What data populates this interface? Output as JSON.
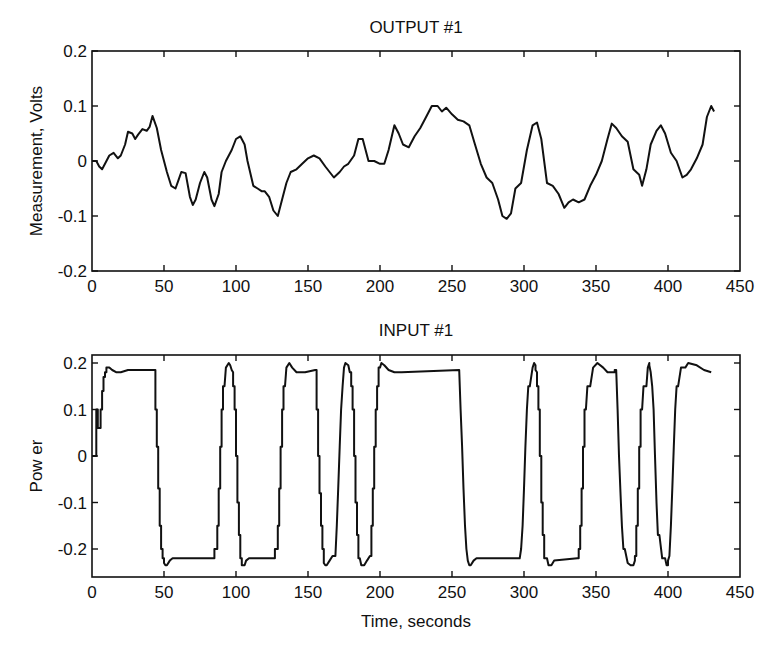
{
  "chart_data": [
    {
      "type": "line",
      "title": "OUTPUT #1",
      "xlabel": "",
      "ylabel": "Measurement, Volts",
      "xlim": [
        0,
        450
      ],
      "ylim": [
        -0.2,
        0.2
      ],
      "xticks": [
        "0",
        "50",
        "100",
        "150",
        "200",
        "250",
        "300",
        "350",
        "400",
        "450"
      ],
      "yticks": [
        "0.2",
        "0.1",
        "0",
        "-0.1",
        "-0.2"
      ],
      "grid": false,
      "series": [
        {
          "name": "output",
          "x": [
            0,
            3,
            5,
            7,
            9,
            12,
            15,
            18,
            20,
            23,
            25,
            28,
            30,
            32,
            35,
            38,
            40,
            42,
            45,
            48,
            52,
            55,
            58,
            60,
            62,
            65,
            68,
            70,
            72,
            75,
            78,
            80,
            83,
            85,
            88,
            90,
            93,
            95,
            97,
            100,
            103,
            106,
            108,
            112,
            115,
            118,
            120,
            123,
            126,
            129,
            132,
            135,
            138,
            142,
            146,
            150,
            154,
            158,
            162,
            165,
            168,
            172,
            175,
            178,
            182,
            185,
            188,
            192,
            196,
            200,
            203,
            206,
            210,
            213,
            216,
            220,
            224,
            228,
            232,
            236,
            240,
            243,
            246,
            250,
            254,
            258,
            262,
            266,
            270,
            274,
            278,
            282,
            285,
            288,
            291,
            294,
            298,
            302,
            306,
            309,
            312,
            316,
            320,
            324,
            328,
            331,
            334,
            338,
            342,
            346,
            350,
            354,
            358,
            361,
            364,
            368,
            372,
            376,
            380,
            382,
            385,
            388,
            392,
            395,
            398,
            402,
            406,
            410,
            413,
            416,
            420,
            424,
            427,
            430,
            432
          ],
          "y": [
            0.0,
            0.0,
            -0.01,
            -0.015,
            -0.005,
            0.01,
            0.015,
            0.005,
            0.01,
            0.03,
            0.053,
            0.05,
            0.04,
            0.048,
            0.058,
            0.055,
            0.062,
            0.082,
            0.06,
            0.02,
            -0.02,
            -0.045,
            -0.05,
            -0.035,
            -0.02,
            -0.022,
            -0.065,
            -0.08,
            -0.07,
            -0.04,
            -0.02,
            -0.03,
            -0.07,
            -0.082,
            -0.06,
            -0.02,
            0.0,
            0.01,
            0.02,
            0.04,
            0.045,
            0.03,
            0.0,
            -0.045,
            -0.05,
            -0.055,
            -0.055,
            -0.065,
            -0.09,
            -0.1,
            -0.07,
            -0.04,
            -0.02,
            -0.015,
            -0.005,
            0.005,
            0.01,
            0.005,
            -0.01,
            -0.02,
            -0.03,
            -0.02,
            -0.01,
            -0.005,
            0.01,
            0.04,
            0.04,
            0.0,
            0.0,
            -0.005,
            -0.005,
            0.02,
            0.065,
            0.05,
            0.03,
            0.025,
            0.045,
            0.06,
            0.08,
            0.1,
            0.1,
            0.09,
            0.097,
            0.085,
            0.075,
            0.072,
            0.065,
            0.03,
            -0.005,
            -0.03,
            -0.04,
            -0.07,
            -0.1,
            -0.105,
            -0.095,
            -0.05,
            -0.04,
            0.02,
            0.065,
            0.07,
            0.04,
            -0.04,
            -0.045,
            -0.06,
            -0.085,
            -0.075,
            -0.07,
            -0.075,
            -0.07,
            -0.045,
            -0.025,
            0.0,
            0.04,
            0.068,
            0.06,
            0.045,
            0.035,
            -0.015,
            -0.025,
            -0.045,
            -0.015,
            0.03,
            0.055,
            0.065,
            0.05,
            0.015,
            0.0,
            -0.03,
            -0.025,
            -0.015,
            0.005,
            0.03,
            0.08,
            0.1,
            0.09
          ]
        }
      ]
    },
    {
      "type": "line",
      "title": "INPUT #1",
      "xlabel": "Time, seconds",
      "ylabel": "Pow er",
      "xlim": [
        0,
        450
      ],
      "ylim": [
        -0.26,
        0.217
      ],
      "xticks": [
        "0",
        "50",
        "100",
        "150",
        "200",
        "250",
        "300",
        "350",
        "400",
        "450"
      ],
      "yticks": [
        "0.2",
        "0.1",
        "0",
        "-0.1",
        "-0.2"
      ],
      "grid": false,
      "series": [
        {
          "name": "input",
          "x": [
            0,
            3,
            3,
            4,
            4,
            6,
            6,
            7,
            7,
            8,
            8,
            9,
            9,
            10,
            10,
            12,
            14,
            17,
            20,
            25,
            27,
            44,
            44,
            45,
            45,
            46,
            46,
            47,
            47,
            48,
            48,
            49,
            49,
            50,
            50,
            51,
            52,
            54,
            56,
            58,
            85,
            85,
            87,
            87,
            88,
            88,
            89,
            89,
            90,
            90,
            91,
            91,
            92,
            93,
            95,
            96,
            97,
            98,
            98,
            99,
            99,
            100,
            100,
            101,
            101,
            102,
            102,
            103,
            103,
            104,
            104,
            106,
            107,
            109,
            111,
            113,
            127,
            127,
            129,
            129,
            130,
            130,
            131,
            131,
            132,
            132,
            133,
            133,
            134,
            135,
            137,
            139,
            142,
            148,
            155,
            156,
            156,
            157,
            157,
            158,
            158,
            159,
            159,
            160,
            160,
            161,
            161,
            162,
            163,
            165,
            167,
            169,
            170,
            170,
            171,
            171,
            172,
            172,
            173,
            173,
            174,
            174,
            175,
            176,
            178,
            179,
            180,
            180,
            181,
            181,
            182,
            182,
            183,
            183,
            184,
            184,
            185,
            185,
            186,
            187,
            189,
            191,
            193,
            194,
            194,
            195,
            195,
            196,
            196,
            197,
            197,
            198,
            198,
            199,
            199,
            200,
            201,
            203,
            206,
            210,
            215,
            255,
            255,
            256,
            256,
            257,
            257,
            258,
            258,
            259,
            259,
            260,
            260,
            261,
            261,
            262,
            263,
            265,
            267,
            297,
            297,
            298,
            298,
            299,
            299,
            300,
            300,
            301,
            301,
            302,
            302,
            303,
            304,
            306,
            307,
            308,
            308,
            309,
            309,
            310,
            310,
            311,
            311,
            312,
            312,
            313,
            313,
            314,
            314,
            316,
            317,
            319,
            321,
            337,
            337,
            338,
            338,
            339,
            339,
            340,
            340,
            341,
            341,
            342,
            342,
            343,
            344,
            346,
            348,
            351,
            355,
            358,
            363,
            363,
            364,
            364,
            365,
            365,
            366,
            366,
            367,
            367,
            368,
            368,
            369,
            370,
            372,
            374,
            376,
            377,
            377,
            378,
            378,
            379,
            379,
            380,
            380,
            381,
            381,
            382,
            383,
            385,
            386,
            387,
            387,
            388,
            388,
            389,
            389,
            390,
            390,
            391,
            391,
            392,
            392,
            393,
            394,
            396,
            398,
            399,
            400,
            400,
            401,
            401,
            402,
            402,
            403,
            403,
            404,
            404,
            405,
            405,
            406,
            407,
            409,
            412,
            414,
            420,
            425,
            430
          ],
          "y": [
            0.0,
            0.0,
            0.1,
            0.1,
            0.06,
            0.06,
            0.1,
            0.1,
            0.14,
            0.14,
            0.17,
            0.17,
            0.18,
            0.18,
            0.19,
            0.19,
            0.185,
            0.18,
            0.18,
            0.185,
            0.185,
            0.185,
            0.1,
            0.1,
            0.02,
            0.02,
            -0.07,
            -0.07,
            -0.15,
            -0.15,
            -0.2,
            -0.2,
            -0.22,
            -0.22,
            -0.23,
            -0.235,
            -0.235,
            -0.225,
            -0.22,
            -0.22,
            -0.22,
            -0.2,
            -0.2,
            -0.15,
            -0.15,
            -0.07,
            -0.07,
            0.02,
            0.02,
            0.1,
            0.1,
            0.15,
            0.15,
            0.19,
            0.2,
            0.195,
            0.185,
            0.18,
            0.15,
            0.15,
            0.1,
            0.1,
            0.0,
            0.0,
            -0.1,
            -0.1,
            -0.17,
            -0.17,
            -0.22,
            -0.22,
            -0.235,
            -0.235,
            -0.225,
            -0.22,
            -0.22,
            -0.22,
            -0.22,
            -0.2,
            -0.2,
            -0.15,
            -0.15,
            -0.07,
            -0.07,
            0.02,
            0.02,
            0.1,
            0.1,
            0.15,
            0.15,
            0.19,
            0.2,
            0.19,
            0.18,
            0.18,
            0.185,
            0.185,
            0.1,
            0.1,
            0.0,
            0.0,
            -0.08,
            -0.08,
            -0.15,
            -0.15,
            -0.2,
            -0.2,
            -0.23,
            -0.235,
            -0.235,
            -0.225,
            -0.215,
            -0.215,
            -0.15,
            -0.15,
            -0.07,
            -0.07,
            0.02,
            0.02,
            0.1,
            0.1,
            0.15,
            0.15,
            0.19,
            0.2,
            0.195,
            0.18,
            0.18,
            0.15,
            0.15,
            0.1,
            0.1,
            0.0,
            0.0,
            -0.1,
            -0.1,
            -0.17,
            -0.17,
            -0.22,
            -0.22,
            -0.235,
            -0.235,
            -0.225,
            -0.215,
            -0.215,
            -0.15,
            -0.15,
            -0.07,
            -0.07,
            0.02,
            0.02,
            0.1,
            0.1,
            0.15,
            0.15,
            0.19,
            0.19,
            0.2,
            0.195,
            0.185,
            0.18,
            0.18,
            0.185,
            0.185,
            0.1,
            0.1,
            0.02,
            0.02,
            -0.07,
            -0.07,
            -0.15,
            -0.15,
            -0.2,
            -0.2,
            -0.225,
            -0.225,
            -0.235,
            -0.235,
            -0.225,
            -0.22,
            -0.22,
            -0.22,
            -0.2,
            -0.2,
            -0.15,
            -0.15,
            -0.07,
            -0.07,
            0.02,
            0.02,
            0.1,
            0.1,
            0.15,
            0.15,
            0.19,
            0.2,
            0.195,
            0.185,
            0.18,
            0.15,
            0.15,
            0.1,
            0.1,
            0.0,
            0.0,
            -0.1,
            -0.1,
            -0.17,
            -0.17,
            -0.22,
            -0.22,
            -0.235,
            -0.235,
            -0.225,
            -0.22,
            -0.22,
            -0.22,
            -0.2,
            -0.2,
            -0.15,
            -0.15,
            -0.07,
            -0.07,
            0.02,
            0.02,
            0.1,
            0.1,
            0.15,
            0.15,
            0.19,
            0.2,
            0.19,
            0.18,
            0.18,
            0.185,
            0.185,
            0.185,
            0.1,
            0.1,
            0.0,
            0.0,
            -0.08,
            -0.08,
            -0.15,
            -0.15,
            -0.2,
            -0.2,
            -0.23,
            -0.235,
            -0.235,
            -0.225,
            -0.215,
            -0.215,
            -0.15,
            -0.15,
            -0.07,
            -0.07,
            0.02,
            0.02,
            0.1,
            0.1,
            0.15,
            0.15,
            0.19,
            0.2,
            0.195,
            0.18,
            0.18,
            0.15,
            0.15,
            0.1,
            0.1,
            0.0,
            0.0,
            -0.1,
            -0.1,
            -0.17,
            -0.17,
            -0.22,
            -0.22,
            -0.235,
            -0.235,
            -0.225,
            -0.215,
            -0.215,
            -0.15,
            -0.15,
            -0.07,
            -0.07,
            0.02,
            0.02,
            0.1,
            0.1,
            0.15,
            0.15,
            0.19,
            0.19,
            0.2,
            0.195,
            0.185,
            0.18,
            0.18,
            0.185,
            0.185
          ]
        }
      ]
    }
  ],
  "plots": {
    "top": {
      "title": "OUTPUT #1",
      "ylabel": "Measurement, Volts",
      "xticks": [
        "0",
        "50",
        "100",
        "150",
        "200",
        "250",
        "300",
        "350",
        "400",
        "450"
      ],
      "yticks": [
        "0.2",
        "0.1",
        "0",
        "-0.1",
        "-0.2"
      ]
    },
    "bottom": {
      "title": "INPUT #1",
      "ylabel": "Pow er",
      "xlabel": "Time, seconds",
      "xticks": [
        "0",
        "50",
        "100",
        "150",
        "200",
        "250",
        "300",
        "350",
        "400",
        "450"
      ],
      "yticks": [
        "0.2",
        "0.1",
        "0",
        "-0.1",
        "-0.2"
      ]
    }
  },
  "colors": {
    "line": "#111111",
    "background": "#ffffff"
  }
}
